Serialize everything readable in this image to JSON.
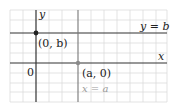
{
  "figure": {
    "labels": {
      "y_axis": "y",
      "x_axis": "x",
      "horizontal_line": "y = b",
      "vertical_line": "x = a",
      "origin": "0",
      "point_on_y_axis": "(0, b)",
      "point_on_x_axis": "(a, 0)"
    },
    "colors": {
      "grid": "#d9d9d9",
      "axis": "#333333",
      "vertical_line": "#777777",
      "point_black": "#222222",
      "point_gray": "#8a8a8a",
      "gray_label": "#9a9a9a"
    }
  }
}
